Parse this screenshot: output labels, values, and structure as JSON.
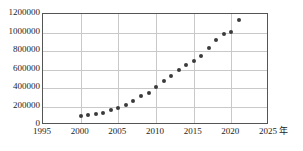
{
  "chart_data": {
    "type": "scatter",
    "title": "",
    "xlabel": "年",
    "ylabel": "",
    "xlim": [
      1995,
      2025
    ],
    "ylim": [
      0,
      1200000
    ],
    "grid": true,
    "legend": null,
    "x_ticks": [
      "1995",
      "2000",
      "2005",
      "2010",
      "2015",
      "2020",
      "2025"
    ],
    "x_tick_values": [
      1995,
      2000,
      2005,
      2010,
      2015,
      2020,
      2025
    ],
    "y_ticks": [
      "0",
      "200000",
      "400000",
      "600000",
      "800000",
      "1000000",
      "1200000"
    ],
    "y_tick_values": [
      0,
      200000,
      400000,
      600000,
      800000,
      1000000,
      1200000
    ],
    "x": [
      2000,
      2001,
      2002,
      2003,
      2004,
      2005,
      2006,
      2007,
      2008,
      2009,
      2010,
      2011,
      2012,
      2013,
      2014,
      2015,
      2016,
      2017,
      2018,
      2019,
      2020,
      2021
    ],
    "values": [
      100000,
      110000,
      120000,
      135000,
      160000,
      185000,
      215000,
      265000,
      310000,
      345000,
      410000,
      480000,
      535000,
      590000,
      645000,
      690000,
      745000,
      830000,
      915000,
      985000,
      1010000,
      1140000
    ],
    "series": [
      {
        "name": "data",
        "marker": "circle",
        "color": "#3b3b3b",
        "values": [
          100000,
          110000,
          120000,
          135000,
          160000,
          185000,
          215000,
          265000,
          310000,
          345000,
          410000,
          480000,
          535000,
          590000,
          645000,
          690000,
          745000,
          830000,
          915000,
          985000,
          1010000,
          1140000
        ]
      }
    ]
  },
  "axes": {
    "unit_label": "年",
    "grid_color": "#c9c9c9",
    "frame_color": "#555555",
    "point_color": "#3b3b3b"
  }
}
